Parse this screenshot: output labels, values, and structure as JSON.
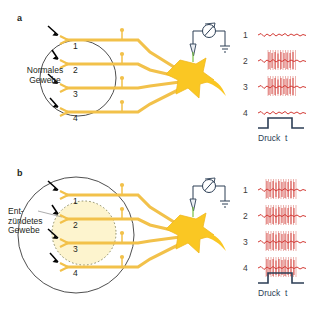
{
  "figure": {
    "type": "scientific-diagram",
    "language": "de",
    "colors": {
      "fiber": "#f2c14a",
      "fiber_light": "#fbe3a0",
      "soma": "#f6c game",
      "soma_fill": "#fac723",
      "trace": "#d33b36",
      "burst": "#e8a49f",
      "pulse": "#2c3e55",
      "outline": "#3b3b3b",
      "text": "#231f20",
      "inflamed_fill": "#fdf2c4"
    }
  },
  "panels": [
    {
      "id": "a",
      "letter": "a",
      "tissue_label": "Normales\nGewebe",
      "tissue_kind": "normal",
      "fiber_numbers": [
        "1",
        "2",
        "3",
        "4"
      ],
      "trace_numbers": [
        "1",
        "2",
        "3",
        "4"
      ],
      "traces": [
        {
          "number": "1",
          "active": false
        },
        {
          "number": "2",
          "active": true
        },
        {
          "number": "3",
          "active": true
        },
        {
          "number": "4",
          "active": false
        }
      ],
      "stimulus_label": "Druck  t"
    },
    {
      "id": "b",
      "letter": "b",
      "tissue_label": "Ent-\nzündetes\nGewebe",
      "tissue_kind": "inflamed",
      "fiber_numbers": [
        "1",
        "2",
        "3",
        "4"
      ],
      "trace_numbers": [
        "1",
        "2",
        "3",
        "4"
      ],
      "traces": [
        {
          "number": "1",
          "active": true
        },
        {
          "number": "2",
          "active": true
        },
        {
          "number": "3",
          "active": true
        },
        {
          "number": "4",
          "active": true
        }
      ],
      "stimulus_label": "Druck  t"
    }
  ],
  "recording": {
    "amplifier_icon": "variable-meter-icon",
    "electrode_icon": "electrode-icon",
    "ground_icon": "ground-icon"
  }
}
